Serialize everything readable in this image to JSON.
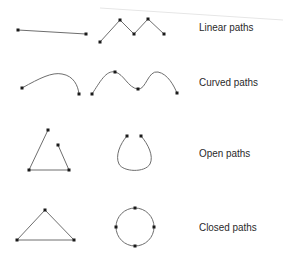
{
  "diagram": {
    "rows": [
      {
        "label": "Linear paths",
        "examples": [
          {
            "type": "polyline",
            "points": [
              [
                18,
                30
              ],
              [
                86,
                34
              ]
            ]
          },
          {
            "type": "polyline",
            "points": [
              [
                100,
                42
              ],
              [
                120,
                20
              ],
              [
                134,
                34
              ],
              [
                148,
                19
              ],
              [
                164,
                34
              ]
            ]
          }
        ]
      },
      {
        "label": "Curved paths",
        "examples": [
          {
            "type": "curve",
            "anchors": [
              [
                22,
                88
              ],
              [
                79,
                94
              ]
            ]
          },
          {
            "type": "curve",
            "anchors": [
              [
                92,
                94
              ],
              [
                115,
                72
              ],
              [
                138,
                89
              ],
              [
                177,
                93
              ]
            ]
          }
        ]
      },
      {
        "label": "Open paths",
        "examples": [
          {
            "type": "polyline",
            "points": [
              [
                48,
                130
              ],
              [
                29,
                170
              ],
              [
                69,
                170
              ],
              [
                58,
                145
              ]
            ]
          },
          {
            "type": "open-loop",
            "anchors": [
              [
                127,
                136
              ],
              [
                141,
                136
              ]
            ]
          }
        ]
      },
      {
        "label": "Closed paths",
        "examples": [
          {
            "type": "polygon",
            "points": [
              [
                45,
                210
              ],
              [
                17,
                240
              ],
              [
                74,
                240
              ]
            ]
          },
          {
            "type": "circle",
            "center": [
              135,
              227
            ],
            "radius": 19,
            "anchors": [
              [
                135,
                208
              ],
              [
                116,
                227
              ],
              [
                154,
                227
              ],
              [
                135,
                246
              ]
            ]
          }
        ]
      }
    ],
    "colors": {
      "stroke": "#6e6e6e",
      "anchor": "#1a1a1a",
      "text": "#2a2a2a",
      "background": "#ffffff",
      "guide_line": "#e6e6e6"
    }
  }
}
